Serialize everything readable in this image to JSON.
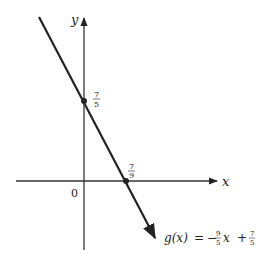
{
  "figure": {
    "axes": {
      "x_label": "x",
      "y_label": "y",
      "origin_label": "0"
    },
    "line": {
      "function_name": "g(x)",
      "equals": "=",
      "slope_sign": "−",
      "slope_num": "9",
      "slope_den": "5",
      "var": "x",
      "plus": "+",
      "intercept_num": "7",
      "intercept_den": "5"
    },
    "points": {
      "y_intercept": {
        "num": "7",
        "den": "5"
      },
      "x_intercept": {
        "num": "7",
        "den": "9"
      }
    },
    "colors": {
      "stroke": "#222222",
      "background": "#ffffff"
    }
  }
}
